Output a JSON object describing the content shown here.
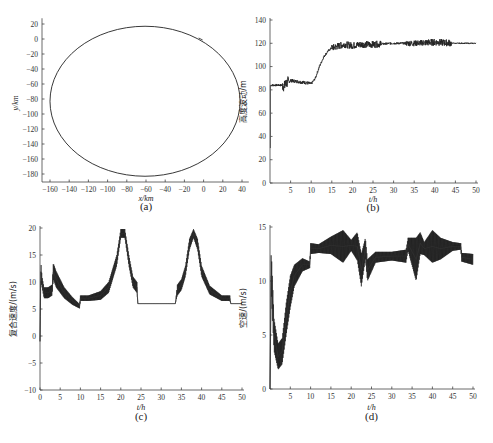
{
  "chart_data": [
    {
      "id": "a",
      "type": "line",
      "caption": "(a)",
      "title": "",
      "xlabel": "x/km",
      "ylabel": "y/km",
      "xlim": [
        -165,
        45
      ],
      "ylim": [
        -190,
        25
      ],
      "xticks": [
        -160,
        -140,
        -120,
        -100,
        -80,
        -60,
        -40,
        -20,
        0,
        20,
        40
      ],
      "yticks": [
        20,
        0,
        -20,
        -40,
        -60,
        -80,
        -100,
        -120,
        -140,
        -160,
        -180
      ],
      "grid": false,
      "description": "Closed elliptical trajectory",
      "ellipse": {
        "center_x": -61,
        "center_y": -83,
        "radius_x": 99,
        "radius_y": 100
      },
      "start_point": {
        "x": -2,
        "y": 0
      }
    },
    {
      "id": "b",
      "type": "line",
      "caption": "(b)",
      "xlabel": "t/h",
      "ylabel": "高度波动/m",
      "xlim": [
        0,
        50
      ],
      "ylim": [
        0,
        140
      ],
      "xticks": [
        5,
        10,
        15,
        20,
        25,
        30,
        35,
        40,
        45,
        50
      ],
      "yticks": [
        0,
        20,
        40,
        60,
        80,
        100,
        120,
        140
      ],
      "grid": false,
      "x": [
        0,
        0.2,
        1,
        3,
        3.5,
        4,
        5,
        7,
        9,
        10,
        11,
        12,
        13,
        14,
        15,
        16,
        17,
        18,
        20,
        22,
        25,
        30,
        35,
        40,
        45,
        50
      ],
      "values": [
        30,
        84,
        84,
        84,
        83,
        86,
        88,
        87,
        86,
        85,
        90,
        100,
        108,
        113,
        116,
        117,
        118,
        119,
        118,
        119,
        119,
        120,
        120,
        121,
        120,
        120
      ],
      "noise_band": {
        "amplitude_by_segment": [
          [
            0,
            3,
            1
          ],
          [
            3,
            4.5,
            5
          ],
          [
            4.5,
            10,
            1.5
          ],
          [
            10,
            15,
            1
          ],
          [
            15,
            27,
            3
          ],
          [
            27,
            33,
            1
          ],
          [
            33,
            37,
            2.5
          ],
          [
            37,
            38,
            3
          ],
          [
            38,
            44,
            3
          ],
          [
            44,
            50,
            0.5
          ]
        ]
      }
    },
    {
      "id": "c",
      "type": "line",
      "caption": "(c)",
      "xlabel": "t/h",
      "ylabel": "复合速度/(m/s)",
      "xlim": [
        0,
        50
      ],
      "ylim": [
        -10,
        20
      ],
      "xticks": [
        0,
        5,
        10,
        15,
        20,
        25,
        30,
        35,
        40,
        45,
        50
      ],
      "yticks": [
        -10,
        -5,
        0,
        5,
        10,
        15,
        20
      ],
      "grid": false,
      "x": [
        0,
        0.2,
        0.5,
        1,
        2,
        3,
        3.3,
        4,
        6,
        8,
        9.8,
        10,
        12,
        15,
        17,
        19,
        20,
        21,
        22,
        23,
        24,
        24.2,
        30,
        33.5,
        34,
        35,
        36,
        37,
        38,
        39,
        40,
        42,
        45,
        47,
        47.2,
        50
      ],
      "values": [
        -1,
        12,
        10,
        8,
        8,
        8.5,
        12,
        10.5,
        8,
        6.5,
        5.5,
        7,
        7,
        7.5,
        9,
        14,
        19,
        19,
        14,
        10,
        9,
        6,
        6,
        6,
        8.5,
        9.5,
        12,
        17,
        19,
        17,
        12,
        8.5,
        7,
        7,
        6,
        6
      ],
      "band_halfwidth": [
        0,
        2,
        1,
        1,
        1,
        1,
        1.5,
        1.5,
        1,
        0.7,
        0.4,
        0.5,
        0.5,
        0.8,
        1,
        1,
        0.8,
        0.8,
        1,
        1,
        1,
        0,
        0,
        0,
        1,
        1,
        1,
        1,
        0.8,
        1,
        1,
        0.8,
        0.5,
        0.5,
        0,
        0
      ]
    },
    {
      "id": "d",
      "type": "line",
      "caption": "(d)",
      "xlabel": "t/h",
      "ylabel": "空速/(m/s)",
      "xlim": [
        0,
        50
      ],
      "ylim": [
        0,
        15
      ],
      "xticks": [
        5,
        10,
        15,
        20,
        25,
        30,
        35,
        40,
        45,
        50
      ],
      "yticks": [
        0,
        5,
        10,
        15
      ],
      "grid": false,
      "x": [
        0,
        0.3,
        1,
        2,
        3,
        4,
        5,
        6,
        8,
        9.8,
        10,
        12,
        15,
        18,
        20,
        21.5,
        22.5,
        23.5,
        24,
        26,
        30,
        33.5,
        34,
        36,
        37,
        38,
        40,
        42,
        45,
        47,
        47.2,
        50
      ],
      "values": [
        0,
        11,
        5,
        3,
        3.5,
        6.5,
        9,
        10.5,
        11.5,
        11.5,
        13,
        13,
        13.3,
        13.2,
        13.3,
        13.2,
        11,
        13,
        11,
        12.2,
        12.3,
        12.3,
        13.4,
        12,
        13.5,
        13,
        13.2,
        13,
        13.2,
        13.2,
        12.2,
        12
      ],
      "band_halfwidth": [
        0,
        2,
        1.5,
        1.2,
        1.2,
        1.5,
        1.5,
        1,
        0.6,
        0.3,
        0.5,
        0.4,
        0.8,
        1.5,
        0.5,
        1.3,
        1.5,
        1,
        1,
        0.5,
        0.4,
        0.6,
        0.6,
        2,
        1,
        0.6,
        1.5,
        1,
        0.4,
        0.3,
        0.4,
        0.5
      ]
    }
  ]
}
